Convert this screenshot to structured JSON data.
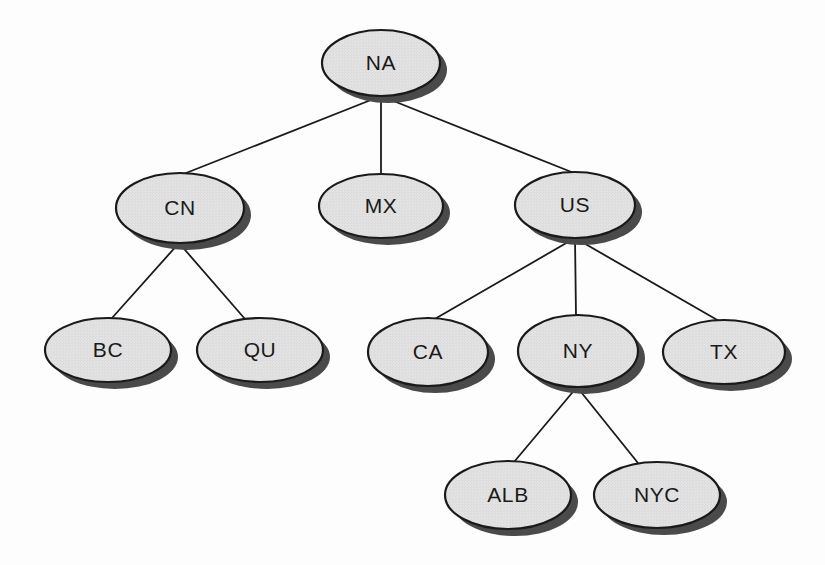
{
  "diagram": {
    "type": "tree",
    "background_color": "#fdfdfd",
    "node_fill_color": "#e0e0e0",
    "node_stroke_color": "#1a1a1a",
    "node_shadow_color": "#4a4a4a",
    "edge_color": "#1a1a1a",
    "label_color": "#1a1a1a",
    "nodes": [
      {
        "id": "NA",
        "label": "NA",
        "cx": 381,
        "cy": 63,
        "rx": 59,
        "ry": 33,
        "level": 0
      },
      {
        "id": "CN",
        "label": "CN",
        "cx": 180,
        "cy": 208,
        "rx": 64,
        "ry": 35,
        "level": 1
      },
      {
        "id": "MX",
        "label": "MX",
        "cx": 381,
        "cy": 206,
        "rx": 62,
        "ry": 32,
        "level": 1
      },
      {
        "id": "US",
        "label": "US",
        "cx": 575,
        "cy": 205,
        "rx": 60,
        "ry": 33,
        "level": 1
      },
      {
        "id": "BC",
        "label": "BC",
        "cx": 108,
        "cy": 350,
        "rx": 63,
        "ry": 32,
        "level": 2
      },
      {
        "id": "QU",
        "label": "QU",
        "cx": 260,
        "cy": 350,
        "rx": 63,
        "ry": 32,
        "level": 2
      },
      {
        "id": "CA",
        "label": "CA",
        "cx": 428,
        "cy": 352,
        "rx": 60,
        "ry": 34,
        "level": 2
      },
      {
        "id": "NY",
        "label": "NY",
        "cx": 578,
        "cy": 351,
        "rx": 60,
        "ry": 36,
        "level": 2
      },
      {
        "id": "TX",
        "label": "TX",
        "cx": 724,
        "cy": 352,
        "rx": 61,
        "ry": 32,
        "level": 2
      },
      {
        "id": "ALB",
        "label": "ALB",
        "cx": 508,
        "cy": 495,
        "rx": 63,
        "ry": 34,
        "level": 3
      },
      {
        "id": "NYC",
        "label": "NYC",
        "cx": 657,
        "cy": 495,
        "rx": 63,
        "ry": 33,
        "level": 3
      }
    ],
    "edges": [
      {
        "from": "NA",
        "to": "CN",
        "x1": 381,
        "y1": 96,
        "x2": 181,
        "y2": 175
      },
      {
        "from": "NA",
        "to": "MX",
        "x1": 381,
        "y1": 96,
        "x2": 381,
        "y2": 174
      },
      {
        "from": "NA",
        "to": "US",
        "x1": 381,
        "y1": 96,
        "x2": 574,
        "y2": 173
      },
      {
        "from": "CN",
        "to": "BC",
        "x1": 179,
        "y1": 243,
        "x2": 112,
        "y2": 318
      },
      {
        "from": "CN",
        "to": "QU",
        "x1": 179,
        "y1": 243,
        "x2": 245,
        "y2": 319
      },
      {
        "from": "US",
        "to": "CA",
        "x1": 575,
        "y1": 238,
        "x2": 433,
        "y2": 320
      },
      {
        "from": "US",
        "to": "NY",
        "x1": 575,
        "y1": 238,
        "x2": 576,
        "y2": 316
      },
      {
        "from": "US",
        "to": "TX",
        "x1": 575,
        "y1": 238,
        "x2": 719,
        "y2": 321
      },
      {
        "from": "NY",
        "to": "ALB",
        "x1": 577,
        "y1": 387,
        "x2": 514,
        "y2": 462
      },
      {
        "from": "NY",
        "to": "NYC",
        "x1": 577,
        "y1": 387,
        "x2": 638,
        "y2": 463
      }
    ]
  }
}
